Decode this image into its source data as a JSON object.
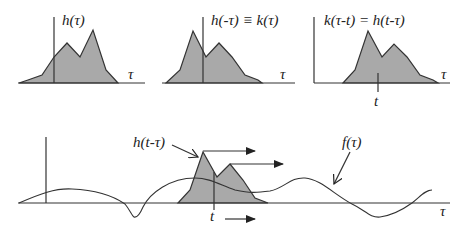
{
  "panels": [
    {
      "id": "h_of_tau",
      "label": "h(τ)",
      "axis_label": "τ"
    },
    {
      "id": "h_of_minus_tau",
      "label": "h(-τ) ≡ k(τ)",
      "axis_label": "τ"
    },
    {
      "id": "k_shifted",
      "label": "k(τ-t) = h(t-τ)",
      "axis_label": "τ",
      "tick_label": "t"
    }
  ],
  "bottom": {
    "pulse_label": "h(t-τ)",
    "signal_label": "f(τ)",
    "axis_label": "τ",
    "tick_label": "t"
  },
  "colors": {
    "fill": "#a9a9a9",
    "stroke": "#333333",
    "background": "#ffffff"
  }
}
